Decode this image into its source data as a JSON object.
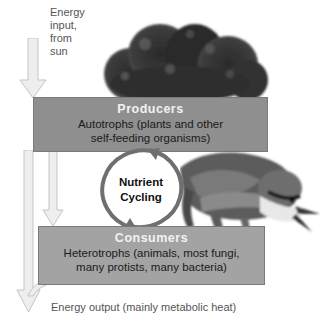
{
  "energy_input": {
    "label_lines": [
      "Energy",
      "input,",
      "from",
      "sun"
    ]
  },
  "producers": {
    "title": "Producers",
    "line1": "Autotrophs (plants and other",
    "line2": "self-feeding organisms)"
  },
  "cycle": {
    "line1": "Nutrient",
    "line2": "Cycling"
  },
  "consumers": {
    "title": "Consumers",
    "line1": "Heterotrophs (animals, most fungi,",
    "line2": "many protists, many bacteria)"
  },
  "energy_output": {
    "label": "Energy output (mainly metabolic heat)"
  },
  "images": {
    "tree": "tree-photo",
    "bird": "blue-jay-photo"
  },
  "colors": {
    "producers_box": "#8f8f8f",
    "consumers_box": "#a3a3a3",
    "box_title": "#f2f2f2",
    "arrow_fill": "#eeeeee",
    "arrow_stroke": "#c4c4c4",
    "cycle_arrow": "#6f6f6f"
  }
}
